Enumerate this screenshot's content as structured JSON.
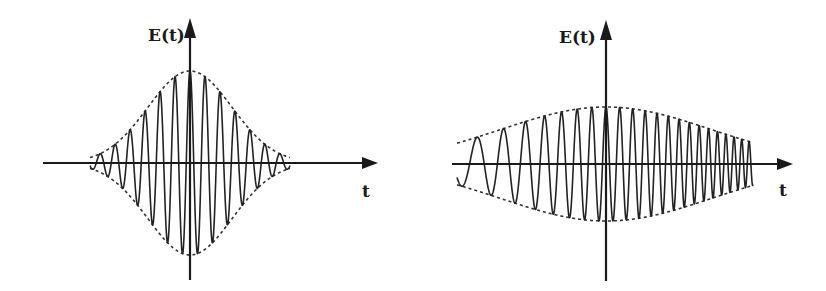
{
  "figure": {
    "panels": [
      {
        "id": "short-pulse",
        "y_axis_label": "E(t)",
        "x_axis_label": "t",
        "axis_origin": {
          "x": 190,
          "y": 163
        },
        "x_axis_range_px": [
          43,
          378
        ],
        "y_axis_range_px": [
          280,
          18
        ],
        "envelope": {
          "shape": "gaussian",
          "amplitude_px": 92,
          "sigma_px": 42,
          "style": "dashed"
        },
        "carrier": {
          "period_px": 15,
          "chirp": "none",
          "phase": "cos"
        }
      },
      {
        "id": "chirped-pulse",
        "y_axis_label": "E(t)",
        "x_axis_label": "t",
        "axis_origin": {
          "x": 606,
          "y": 164
        },
        "x_axis_range_px": [
          452,
          793
        ],
        "y_axis_range_px": [
          281,
          20
        ],
        "envelope": {
          "shape": "gaussian",
          "amplitude_px": 57,
          "sigma_px": 105,
          "style": "dashed"
        },
        "carrier": {
          "period_left_px": 34,
          "period_center_px": 14,
          "period_right_px": 7,
          "chirp": "up-chirp",
          "phase": "cos"
        }
      }
    ],
    "colors": {
      "ink": "#1a1a1a",
      "background": "#ffffff"
    }
  }
}
